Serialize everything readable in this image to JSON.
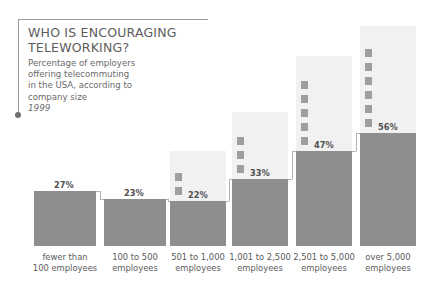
{
  "title": {
    "headline_line1": "WHO IS ENCOURAGING",
    "headline_line2": "TELEWORKING?",
    "subtitle_line1": "Percentage of employers",
    "subtitle_line2": "offering telecommuting",
    "subtitle_line3": "in the USA, according to",
    "subtitle_line4": "company size",
    "year": "1999"
  },
  "colors": {
    "solid_bar": "#8e8e8e",
    "light_column": "#f1f1f1",
    "marker": "#9e9e9e",
    "connector": "#b4b4b4",
    "rule": "#9a9a9a",
    "text": "#5a5a5a"
  },
  "chart_data": {
    "type": "bar",
    "title": "WHO IS ENCOURAGING TELEWORKING?",
    "subtitle": "Percentage of employers offering telecommuting in the USA, according to company size",
    "year": "1999",
    "xlabel": "",
    "ylabel": "",
    "ylim": [
      0,
      60
    ],
    "grid": false,
    "legend": false,
    "categories": [
      "fewer than 100 employees",
      "100 to 500 employees",
      "501 to 1,000 employees",
      "1,001 to 2,500 employees",
      "2,501 to 5,000 employees",
      "over 5,000 employees"
    ],
    "values": [
      27,
      23,
      22,
      33,
      47,
      56
    ],
    "value_labels": [
      "27%",
      "23%",
      "22%",
      "33%",
      "47%",
      "56%"
    ],
    "category_labels": [
      {
        "line1": "fewer than",
        "line2": "100 employees"
      },
      {
        "line1": "100 to 500",
        "line2": "employees"
      },
      {
        "line1": "501 to 1,000",
        "line2": "employees"
      },
      {
        "line1": "1,001 to 2,500",
        "line2": "employees"
      },
      {
        "line1": "2,501 to 5,000",
        "line2": "employees"
      },
      {
        "line1": "over 5,000",
        "line2": "employees"
      }
    ]
  }
}
